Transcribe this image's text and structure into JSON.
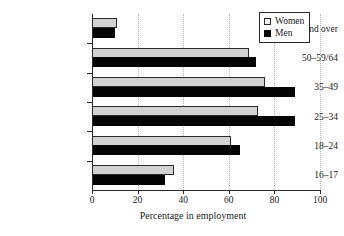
{
  "chart_data": {
    "type": "bar",
    "orientation": "horizontal",
    "title": "",
    "xlabel": "Percentage in employment",
    "ylabel": "",
    "xlim": [
      0,
      100
    ],
    "xticks": [
      0,
      20,
      40,
      60,
      80,
      100
    ],
    "xtick_labels": [
      "0",
      "20",
      "40",
      "60",
      "80",
      "100"
    ],
    "grid": "vertical-dotted",
    "legend_position": "top-right",
    "categories": [
      "16–17",
      "18–24",
      "25–34",
      "35–49",
      "50–59/64",
      "60/65 and over"
    ],
    "series": [
      {
        "name": "Women",
        "color": "#d2d2d2",
        "edge_color": "#2b2b2b",
        "values": [
          36,
          61,
          73,
          76,
          69,
          11
        ]
      },
      {
        "name": "Men",
        "color": "#050505",
        "edge_color": "#050505",
        "values": [
          32,
          65,
          89,
          89,
          72,
          10
        ]
      }
    ]
  },
  "legend": {
    "items": [
      {
        "label": "Women",
        "swatch": "women-swatch"
      },
      {
        "label": "Men",
        "swatch": "men-swatch"
      }
    ]
  },
  "axis": {
    "x_title": "Percentage in employment",
    "tick_labels": [
      "0",
      "20",
      "40",
      "60",
      "80",
      "100"
    ]
  },
  "categories": [
    "60/65 and over",
    "50–59/64",
    "35–49",
    "25–34",
    "18–24",
    "16–17"
  ],
  "colors": {
    "women_fill": "#d2d2d2",
    "men_fill": "#050505",
    "axis": "#2a2a2a",
    "grid": "#b9b9b9",
    "background": "#ffffff"
  }
}
